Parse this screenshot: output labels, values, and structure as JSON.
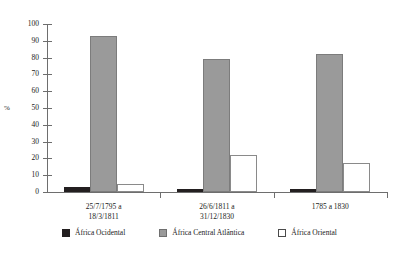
{
  "page": {
    "top_bleed_text": "",
    "bottom_bleed_text": ""
  },
  "chart_data": {
    "type": "bar",
    "title": "",
    "xlabel": "",
    "ylabel": "%",
    "ylim": [
      0,
      100
    ],
    "yticks": [
      0,
      10,
      20,
      30,
      40,
      50,
      60,
      70,
      80,
      90,
      100
    ],
    "grid": false,
    "legend_position": "bottom",
    "categories": [
      "25/7/1795 a\n18/3/1811",
      "26/6/1811 a\n31/12/1830",
      "1785 a 1830"
    ],
    "series": [
      {
        "name": "África Ocidental",
        "color": "#231f20",
        "values": [
          3,
          2,
          1.5
        ]
      },
      {
        "name": "África Central Atlântica",
        "color": "#9a9a9a",
        "values": [
          93,
          79,
          82
        ]
      },
      {
        "name": "África Oriental",
        "color": "#ffffff",
        "values": [
          5,
          22,
          17
        ]
      }
    ]
  }
}
